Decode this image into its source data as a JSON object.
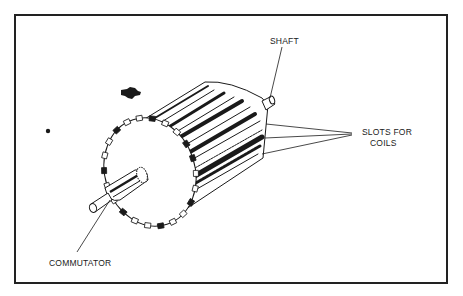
{
  "diagram": {
    "labels": {
      "shaft": "SHAFT",
      "slots_line1": "SLOTS FOR",
      "slots_line2": "COILS",
      "commutator": "COMMUTATOR"
    },
    "colors": {
      "ink": "#1a1a1a",
      "paper": "#ffffff",
      "frame": "#222222"
    }
  }
}
